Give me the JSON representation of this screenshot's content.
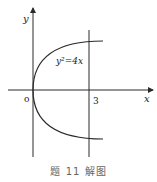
{
  "figure": {
    "equation_label": "y²=4x",
    "x_axis_label": "x",
    "y_axis_label": "y",
    "origin_label": "o",
    "line_label": "3",
    "caption": "题 11 解图"
  },
  "colors": {
    "stroke": "#2a2a2a",
    "text": "#222222",
    "caption": "#666666",
    "background": "#ffffff"
  }
}
